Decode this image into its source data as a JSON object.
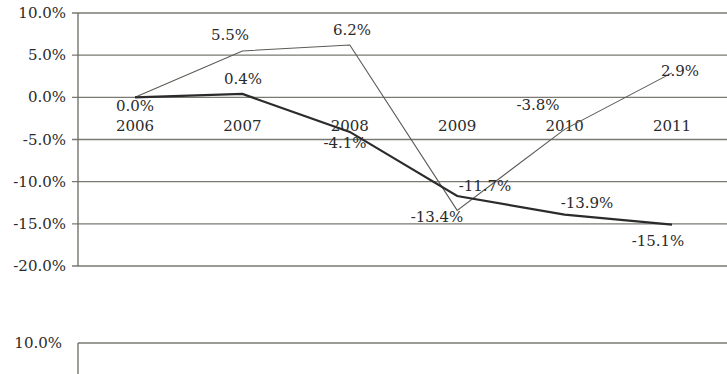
{
  "chart_data": {
    "type": "line",
    "title": "",
    "xlabel": "",
    "ylabel": "",
    "categories": [
      "2006",
      "2007",
      "2008",
      "2009",
      "2010",
      "2011"
    ],
    "series": [
      {
        "name": "series-thin",
        "style": "thin",
        "values": [
          0.0,
          5.5,
          6.2,
          -13.4,
          -3.8,
          2.9
        ],
        "labels": [
          "",
          "5.5%",
          "6.2%",
          "-13.4%",
          "-3.8%",
          "2.9%"
        ]
      },
      {
        "name": "series-thick",
        "style": "thick",
        "values": [
          0.0,
          0.4,
          -4.1,
          -11.7,
          -13.9,
          -15.1
        ],
        "labels": [
          "0.0%",
          "0.4%",
          "-4.1%",
          "-11.7%",
          "-13.9%",
          "-15.1%"
        ]
      }
    ],
    "ylim": [
      -20,
      10
    ],
    "yticks": [
      "10.0%",
      "5.0%",
      "0.0%",
      "-5.0%",
      "-10.0%",
      "-15.0%",
      "-20.0%"
    ],
    "grid": true,
    "legend": "none"
  },
  "second_chart": {
    "ytick_top": "10.0%"
  }
}
